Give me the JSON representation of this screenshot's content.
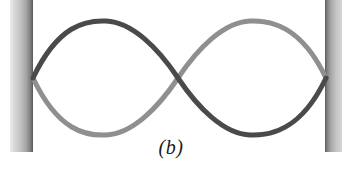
{
  "figure": {
    "caption": "(b)",
    "width": 342,
    "height": 170,
    "background_color": "#ffffff",
    "caption_left": 0,
    "caption_top": 136
  },
  "walls": {
    "left": {
      "name": "left-wall",
      "x": 10,
      "y": 0,
      "width": 23,
      "height": 152,
      "gradient_from": "#e8e8e8",
      "gradient_to": "#5a5a5a",
      "gradient_direction": "left-to-right"
    },
    "right": {
      "name": "right-wall",
      "x": 325,
      "y": 0,
      "width": 17,
      "height": 152,
      "gradient_from": "#5a5a5a",
      "gradient_to": "#d0d0d0",
      "gradient_direction": "left-to-right"
    }
  },
  "wave": {
    "left_anchor_x": 33,
    "right_anchor_x": 326,
    "node_x": 178,
    "axis_y": 78,
    "amplitude": 53,
    "stroke_width": 5,
    "dark_color": "#4a4a4a",
    "light_color": "#8f8f8f",
    "curves": [
      {
        "name": "wave-curve-dark",
        "color": "#4a4a4a",
        "phase": "crest-left-trough-right",
        "path": "M 33 78 C 60 24 90 21 105 22 C 130 24 158 50 178 78 C 198 106 226 132 251 134 C 266 135 300 132 326 78"
      },
      {
        "name": "wave-curve-light",
        "color": "#8f8f8f",
        "phase": "trough-left-crest-right",
        "path": "M 33 78 C 60 132 90 135 105 134 C 130 132 158 106 178 78 C 198 50 226 24 251 22 C 266 21 300 24 326 78"
      }
    ]
  }
}
